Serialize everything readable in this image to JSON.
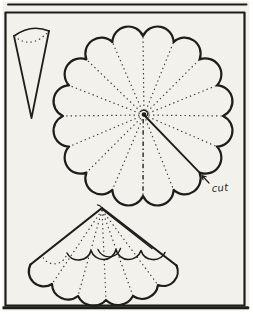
{
  "colors": {
    "paper": "#f3f1ec",
    "ink": "#1d1d1b",
    "faint": "#3f3d39"
  },
  "labels": {
    "cut": "cut"
  },
  "figure": {
    "type": "craft-pattern-diagram",
    "scallop_count": 16,
    "fold_line_style": "dotted",
    "cut_line_style": "solid"
  },
  "svg": {
    "frame_top_rule": "M8,4.5 L246.5,4.5",
    "frame_box": "M5.5,12.5 H244.5 V305.5 H5.5 Z",
    "frame_bottom_shadow": "M2.5,307.8 L248,307.8",
    "segment_sides": "M14,36 L31.5,118 L49,31",
    "segment_top_arc": "M14,36 Q31,23.5 49,31",
    "segment_fold_arc": "M14,36 Q31.5,50.5 49,31",
    "circle_outline": "M223,116 A16,16 0 0 1 216.9,146.6 A16,16 0 0 1 199.6,172.6 A16,16 0 0 1 173.6,189.9 A16,16 0 0 1 143,196 A16,16 0 0 1 112.4,189.9 A16,16 0 0 1 86.4,172.6 A16,16 0 0 1 69.1,146.6 A16,16 0 0 1 63,116 A16,16 0 0 1 69.1,85.4 A16,16 0 0 1 86.4,59.4 A16,16 0 0 1 112.4,42.1 A16,16 0 0 1 143,36 A16,16 0 0 1 173.6,42.1 A16,16 0 0 1 199.6,59.4 A16,16 0 0 1 216.9,85.4 A16,16 0 0 1 223,116 Z",
    "circle_rays": "M144,115 L223,116 M144,115 L216.9,146.6 M144,115 L173.6,189.9 M144,115 L112.4,189.9 M144,115 L86.4,172.6 M144,115 L69.1,146.6 M144,115 L63,116 M144,115 L69.1,85.4 M144,115 L86.4,59.4 M144,115 L112.4,42.1 M144,115 L143,36 M144,115 L173.6,42.1 M144,115 L199.6,59.4 M144,115 L216.9,85.4",
    "circle_cut_line": "M144,115 L199.6,172.6",
    "circle_axis_line": "M143.2,119 L143,196.5",
    "circle_center_scribble": "M140.5,111.5 q4,-3 6.5,0.5 q2,3 -1,4.5",
    "cut_arrow": "M209,183 L202,175.5 M202,175.5 L203,179.7 M202,175.5 L206.1,176.8",
    "parasol_left_edge": "M102,208 L30.5,264.5",
    "parasol_right_edge": "M102,208 L176.5,265.5",
    "parasol_seam": "M102.5,209.5 L152,248.5",
    "parasol_tip_hook": "M102,208 Q100,205 97.5,204.8",
    "parasol_bottom_row": "M30.5,264.5 A15,15 0 0 0 52,284 A16,16 0 0 0 78,296 A17,17 0 0 0 106,300 A17,17 0 0 0 133,296 A16,16 0 0 0 158,285 A14.5,14.5 0 0 0 176.5,265.5",
    "parasol_mid_row": "M67,253 A13,13 0 0 0 91,250.5 A13,13 0 0 0 116,249.5 A13,13 0 0 0 141,250.5 A13,13 0 0 0 165,252.5",
    "parasol_mid_row_hidden": "M43,257.5 A13,13 0 0 0 67,253",
    "parasol_overlap_arc": "M98,249.5 A12,12 0 0 0 120.5,248.5",
    "parasol_fold_lines": "M102,210 L52,284 M102,210 L78,296 M102,210 L106,300 M102,210 L133,296 M102,210 L158,285"
  }
}
